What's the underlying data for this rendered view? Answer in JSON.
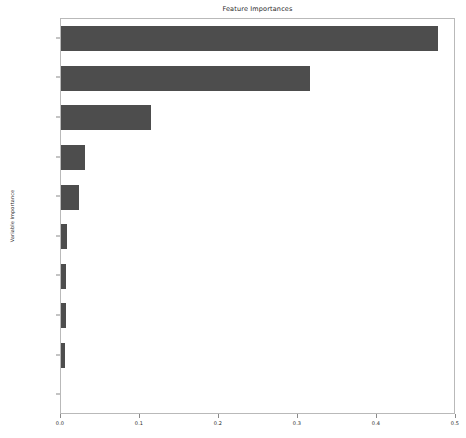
{
  "chart_data": {
    "type": "bar",
    "orientation": "horizontal",
    "title": "Feature Importances",
    "xlabel": "",
    "ylabel": "Variable Importance",
    "categories": [
      "age",
      "numofproducts",
      "isactivemember",
      "geography",
      "balance",
      "gender",
      "estimatedsalary",
      "creditscore",
      "tenure",
      "hascrcard"
    ],
    "values": [
      0.477,
      0.315,
      0.114,
      0.03,
      0.023,
      0.008,
      0.006,
      0.006,
      0.005,
      0.0
    ],
    "xlim": [
      0.0,
      0.5
    ],
    "xticks": [
      "0.0",
      "0.1",
      "0.2",
      "0.3",
      "0.4",
      "0.5"
    ],
    "xtick_values": [
      0.0,
      0.1,
      0.2,
      0.3,
      0.4,
      0.5
    ],
    "grid": false,
    "legend": null,
    "bar_color": "#4d4d4d",
    "background_color": "#ffffff",
    "axes_edge_color": "#b9b9b9"
  }
}
